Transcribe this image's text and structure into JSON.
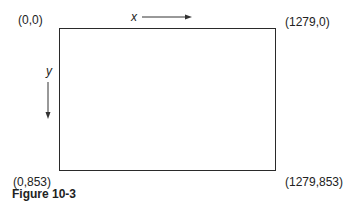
{
  "diagram": {
    "corners": {
      "top_left": "(0,0)",
      "top_right": "(1279,0)",
      "bottom_left": "(0,853)",
      "bottom_right": "(1279,853)"
    },
    "axes": {
      "x_label": "x",
      "y_label": "y"
    },
    "caption": "Figure 10-3"
  }
}
